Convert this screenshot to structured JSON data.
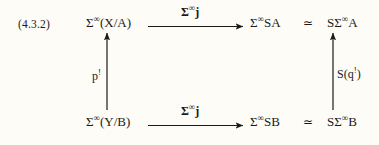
{
  "equation": {
    "tag": "(4.3.2)"
  },
  "diagram": {
    "type": "commutative-square",
    "nodes": {
      "top_left": {
        "prefix": "Σ",
        "sup": "∞",
        "rest": "(X/A)"
      },
      "top_mid": {
        "prefix": "Σ",
        "sup": "∞",
        "rest": "SA"
      },
      "top_right": {
        "prefix": "SΣ",
        "sup": "∞",
        "rest": "A"
      },
      "bot_left": {
        "prefix": "Σ",
        "sup": "∞",
        "rest": "(Y/B)"
      },
      "bot_mid": {
        "prefix": "Σ",
        "sup": "∞",
        "rest": "SB"
      },
      "bot_right": {
        "prefix": "SΣ",
        "sup": "∞",
        "rest": "B"
      }
    },
    "relations": {
      "equiv_top": "≃",
      "equiv_bottom": "≃"
    },
    "arrows": {
      "top_horizontal": {
        "label_prefix": "Σ",
        "label_sup": "∞",
        "label_rest": "j",
        "direction": "right"
      },
      "bottom_horizontal": {
        "label_prefix": "Σ",
        "label_sup": "∞",
        "label_rest": "j",
        "direction": "right"
      },
      "left_vertical": {
        "label_base": "p",
        "label_sup": "!",
        "direction": "up"
      },
      "right_vertical": {
        "label_base": "S(q",
        "label_sup": "!",
        "label_tail": ")",
        "direction": "up"
      }
    }
  },
  "colors": {
    "background": "#fdfcf7",
    "ink": "#1a1a1a"
  }
}
